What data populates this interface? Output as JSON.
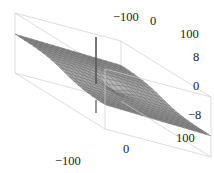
{
  "chart_data": {
    "type": "surface3d",
    "title": "",
    "xlabel": "",
    "ylabel": "",
    "zlabel": "",
    "x_ticks": [
      -100,
      0,
      100
    ],
    "y_ticks": [
      -100,
      0,
      100
    ],
    "z_ticks": [
      8,
      0,
      -8
    ],
    "x_range": [
      -100,
      100
    ],
    "y_range": [
      -100,
      100
    ],
    "z_range": [
      -10,
      10
    ],
    "grid": false,
    "legend": "none",
    "box": true,
    "mesh_lines": 20,
    "surface_color": "#8c8c8c",
    "spike": {
      "x": 0,
      "y": 0,
      "z_top": 10,
      "z_bottom": -10
    },
    "tick_labels": {
      "top_axis": [
        "-100",
        "0",
        "100"
      ],
      "bottom_axis": [
        "-100",
        "0",
        "100"
      ],
      "vertical_axis": [
        "8",
        "0",
        "-8"
      ]
    }
  },
  "colors": {
    "background": "#ffffff",
    "box": "#cfcfcf",
    "surface_light": "#b5b5b5",
    "surface_dark": "#6e6e6e",
    "mesh": "#5a5a5a",
    "spike": "#555555"
  }
}
